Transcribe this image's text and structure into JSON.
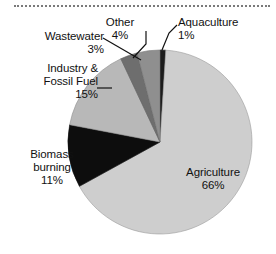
{
  "figure": {
    "background_color": "#ffffff",
    "top_rule": "dotted-divider"
  },
  "chart_data": {
    "type": "pie",
    "title": "",
    "subtitle": "",
    "xlabel": "",
    "ylabel": "",
    "grid": false,
    "legend_position": "none",
    "label_format": "name + percent",
    "start_angle_deg": 0,
    "direction": "clockwise",
    "center_px": [
      160,
      142
    ],
    "radius_px": 92,
    "unit": "%",
    "categories": [
      "Aquaculture",
      "Agriculture",
      "Biomass burning",
      "Industry & Fossil Fuel",
      "Wastewater",
      "Other"
    ],
    "values": [
      1,
      66,
      11,
      15,
      3,
      4
    ],
    "slices": [
      {
        "name": "Aquaculture",
        "label": "Aquaculture",
        "value": 1,
        "percent_text": "1%",
        "color": "#1c1c1c",
        "leader": true
      },
      {
        "name": "Agriculture",
        "label": "Agriculture",
        "value": 66,
        "percent_text": "66%",
        "color": "#cecece",
        "leader": false
      },
      {
        "name": "Biomass burning",
        "label": "Biomass burning",
        "value": 11,
        "percent_text": "11%",
        "color": "#0d0d0d",
        "leader": false
      },
      {
        "name": "Industry & Fossil Fuel",
        "label": "Industry & Fossil Fuel",
        "value": 15,
        "percent_text": "15%",
        "color": "#b8b8b8",
        "leader": true
      },
      {
        "name": "Wastewater",
        "label": "Wastewater",
        "value": 3,
        "percent_text": "3%",
        "color": "#6e6e6e",
        "leader": true
      },
      {
        "name": "Other",
        "label": "Other",
        "value": 4,
        "percent_text": "4%",
        "color": "#8f8f8f",
        "leader": true
      }
    ]
  },
  "callouts": {
    "wastewater": {
      "line1": "Wastewater",
      "pct": "3%"
    },
    "other": {
      "line1": "Other",
      "pct": "4%"
    },
    "aquaculture": {
      "line1": "Aquaculture",
      "pct": "1%"
    },
    "industry": {
      "line1": "Industry &",
      "line2": "Fossil Fuel",
      "pct": "15%"
    },
    "biomass": {
      "line1": "Biomass",
      "line2": "burning",
      "pct": "11%"
    },
    "agriculture": {
      "line1": "Agriculture",
      "pct": "66%"
    }
  }
}
